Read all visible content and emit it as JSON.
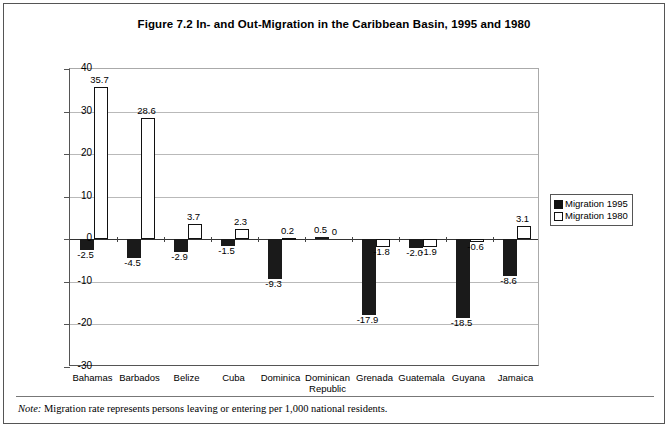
{
  "figure": {
    "title": "Figure 7.2  In- and Out-Migration in the Caribbean Basin, 1995 and 1980",
    "note_label": "Note:",
    "note_text": " Migration rate represents persons leaving or entering per 1,000 national residents."
  },
  "legend": {
    "position": "right-inside",
    "items": [
      {
        "label": "Migration 1995",
        "color": "#111111",
        "style": "filled"
      },
      {
        "label": "Migration 1980",
        "color": "#ffffff",
        "style": "hollow"
      }
    ]
  },
  "axis": {
    "y_ticks": [
      40,
      30,
      20,
      10,
      0,
      -10,
      -20,
      -30
    ],
    "y_tick_labels": [
      "40",
      "30",
      "20",
      "10",
      "0",
      "-10",
      "-20",
      "-30"
    ]
  },
  "chart_data": {
    "type": "bar",
    "title": "Figure 7.2  In- and Out-Migration in the Caribbean Basin, 1995 and 1980",
    "xlabel": "",
    "ylabel": "",
    "ylim": [
      -30,
      40
    ],
    "ytick_step": 10,
    "grid": true,
    "legend_position": "right",
    "categories": [
      "Bahamas",
      "Barbados",
      "Belize",
      "Cuba",
      "Dominica",
      "Dominican Republic",
      "Grenada",
      "Guatemala",
      "Guyana",
      "Jamaica"
    ],
    "series": [
      {
        "name": "Migration 1995",
        "color": "#111111",
        "values": [
          -2.5,
          -4.5,
          -2.9,
          -1.5,
          -9.3,
          0.5,
          -17.9,
          -2.0,
          -18.5,
          -8.6
        ],
        "labels": [
          "-2.5",
          "-4.5",
          "-2.9",
          "-1.5",
          "-9.3",
          "0.5",
          "-17.9",
          "-2.0",
          "-18.5",
          "-8.6"
        ]
      },
      {
        "name": "Migration 1980",
        "color": "#ffffff",
        "values": [
          35.7,
          28.6,
          3.7,
          2.3,
          0.2,
          0,
          -1.8,
          -1.9,
          -0.6,
          3.1
        ],
        "labels": [
          "35.7",
          "28.6",
          "3.7",
          "2.3",
          "0.2",
          "0",
          "-1.8",
          "-1.9",
          "-0.6",
          "3.1"
        ]
      }
    ]
  }
}
